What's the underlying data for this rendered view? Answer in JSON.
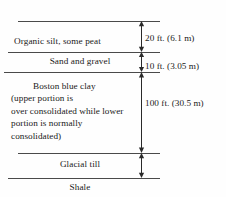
{
  "diagram": {
    "type": "geological-stratigraphy-section",
    "line_color": "#4a4a4a",
    "text_color": "#1a1a1a",
    "background": "#fefefe",
    "strata": [
      {
        "id": "organic-silt",
        "label": "Organic silt, some peat",
        "lines": [
          "Organic silt, some peat"
        ],
        "align": "left"
      },
      {
        "id": "sand-and-gravel",
        "label": "Sand and gravel",
        "lines": [
          "Sand and gravel"
        ],
        "align": "center"
      },
      {
        "id": "boston-blue-clay",
        "label": "Boston blue clay (upper portion is over consolidated while lower portion is normally consolidated)",
        "lines": [
          "Boston blue clay",
          "(upper portion is",
          "over consolidated while lower",
          "portion is normally",
          "consolidated)"
        ],
        "align": "left"
      },
      {
        "id": "glacial-till",
        "label": "Glacial till",
        "lines": [
          "Glacial till"
        ],
        "align": "center"
      },
      {
        "id": "shale",
        "label": "Shale",
        "lines": [
          "Shale"
        ],
        "align": "center"
      }
    ],
    "dimensions": [
      {
        "id": "organic-silt-thickness",
        "for_stratum": "organic-silt",
        "text": "20 ft. (6.1 m)",
        "feet": 20,
        "meters": 6.1
      },
      {
        "id": "sand-and-gravel-thickness",
        "for_stratum": "sand-and-gravel",
        "text": "10 ft. (3.05 m)",
        "feet": 10,
        "meters": 3.05
      },
      {
        "id": "boston-blue-clay-thickness",
        "for_stratum": "boston-blue-clay",
        "text": "100 ft. (30.5 m)",
        "feet": 100,
        "meters": 30.5
      }
    ]
  }
}
